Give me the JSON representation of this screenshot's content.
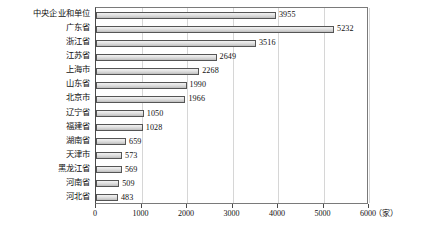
{
  "chart_data": {
    "type": "bar",
    "orientation": "horizontal",
    "title": "",
    "subtitle": "",
    "xlabel": "",
    "ylabel": "",
    "unit_label": "（家）",
    "xlim": [
      0,
      6000
    ],
    "x_ticks": [
      0,
      1000,
      2000,
      3000,
      4000,
      5000,
      6000
    ],
    "x_tick_labels": [
      "0",
      "1000",
      "2000",
      "3000",
      "4000",
      "5000",
      "6000"
    ],
    "grid": true,
    "grid_axis": "x",
    "legend": false,
    "legend_position": "none",
    "categories": [
      "中央企业和单位",
      "广东省",
      "浙江省",
      "江苏省",
      "上海市",
      "山东省",
      "北京市",
      "辽宁省",
      "福建省",
      "湖南省",
      "天津市",
      "黑龙江省",
      "河南省",
      "河北省"
    ],
    "values": [
      3955,
      5232,
      3516,
      2649,
      2268,
      1990,
      1966,
      1050,
      1028,
      659,
      573,
      569,
      509,
      483
    ],
    "data_labels": [
      "3955",
      "5232",
      "3516",
      "2649",
      "2268",
      "1990",
      "1966",
      "1050",
      "1028",
      "659",
      "573",
      "569",
      "509",
      "483"
    ],
    "series": [
      {
        "name": "",
        "values": [
          3955,
          5232,
          3516,
          2649,
          2268,
          1990,
          1966,
          1050,
          1028,
          659,
          573,
          569,
          509,
          483
        ]
      }
    ],
    "colors": {
      "bar_fill_light": "#f2f2f2",
      "bar_fill_dark": "#bdbdbd",
      "bar_border": "#555555",
      "gridline": "#d6d6d6",
      "axis": "#4a4a4a",
      "text": "#111111",
      "background": "#ffffff"
    }
  }
}
